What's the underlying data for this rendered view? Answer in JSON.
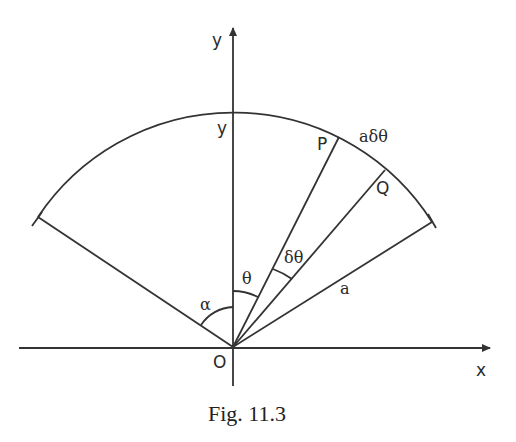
{
  "figure": {
    "caption": "Fig. 11.3",
    "axes": {
      "x_label": "x",
      "y_label": "y",
      "origin_label": "O"
    },
    "points": {
      "top_of_arc": "y",
      "P": "P",
      "Q": "Q"
    },
    "labels": {
      "arc_length": "aδθ",
      "radius": "a",
      "angle_theta": "θ",
      "angle_delta_theta": "δθ",
      "angle_alpha": "α"
    }
  }
}
